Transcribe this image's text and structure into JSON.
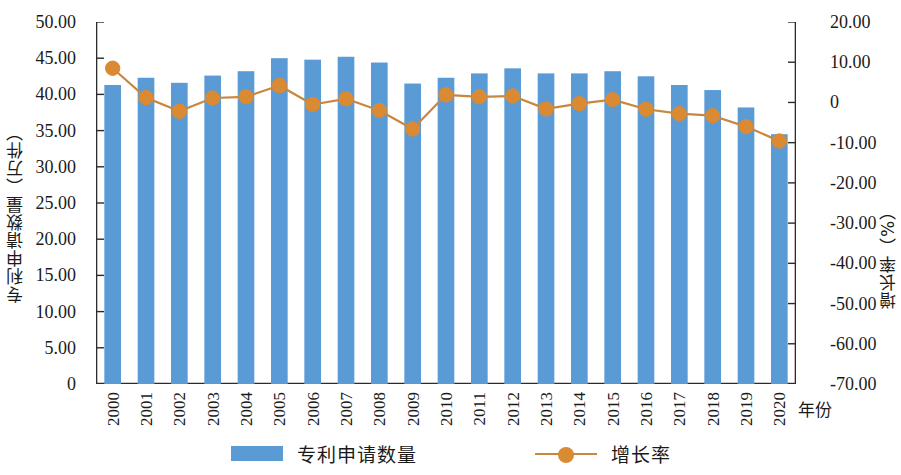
{
  "chart_data": {
    "type": "bar",
    "title": "",
    "xlabel": "年份",
    "ylabel": "专利申请数量（万件）",
    "y2label": "增长率（%）",
    "categories": [
      "2000",
      "2001",
      "2002",
      "2003",
      "2004",
      "2005",
      "2006",
      "2007",
      "2008",
      "2009",
      "2010",
      "2011",
      "2012",
      "2013",
      "2014",
      "2015",
      "2016",
      "2017",
      "2018",
      "2019",
      "2020"
    ],
    "ylim": [
      0,
      50
    ],
    "y2lim": [
      -70,
      20
    ],
    "grid": false,
    "legend_position": "bottom",
    "y_ticks": [
      "0",
      "5.00",
      "10.00",
      "15.00",
      "20.00",
      "25.00",
      "30.00",
      "35.00",
      "40.00",
      "45.00",
      "50.00"
    ],
    "y_tick_values": [
      0,
      5,
      10,
      15,
      20,
      25,
      30,
      35,
      40,
      45,
      50
    ],
    "y2_ticks": [
      "-70.00",
      "-60.00",
      "-50.00",
      "-40.00",
      "-30.00",
      "-20.00",
      "-10.00",
      "0",
      "10.00",
      "20.00"
    ],
    "y2_tick_values": [
      -70,
      -60,
      -50,
      -40,
      -30,
      -20,
      -10,
      0,
      10,
      20
    ],
    "series": [
      {
        "name": "专利申请数量",
        "kind": "bar",
        "axis": "left",
        "unit": "万件",
        "color": "#5B9BD5",
        "values": [
          41.3,
          42.3,
          41.6,
          42.6,
          43.2,
          45.0,
          44.8,
          45.2,
          44.4,
          41.5,
          42.3,
          42.9,
          43.6,
          42.9,
          42.9,
          43.2,
          42.5,
          41.3,
          40.6,
          38.2,
          34.5
        ]
      },
      {
        "name": "增长率",
        "kind": "line",
        "axis": "right",
        "unit": "%",
        "color": "#D98A33",
        "line_color": "#C8863F",
        "values": [
          8.5,
          1.2,
          -2.2,
          1.1,
          1.4,
          4.2,
          -0.5,
          0.9,
          -2.0,
          -6.6,
          1.9,
          1.4,
          1.6,
          -1.6,
          -0.3,
          0.7,
          -1.7,
          -2.8,
          -3.3,
          -6.0,
          -9.6
        ]
      }
    ]
  },
  "legend": {
    "items": [
      {
        "label": "专利申请数量",
        "type": "bar",
        "color": "#5B9BD5"
      },
      {
        "label": "增长率",
        "type": "line",
        "color": "#D98A33"
      }
    ]
  },
  "axes": {
    "left_title": "专利申请数量（万件）",
    "right_title": "增长率（%）",
    "x_title": "年份"
  }
}
